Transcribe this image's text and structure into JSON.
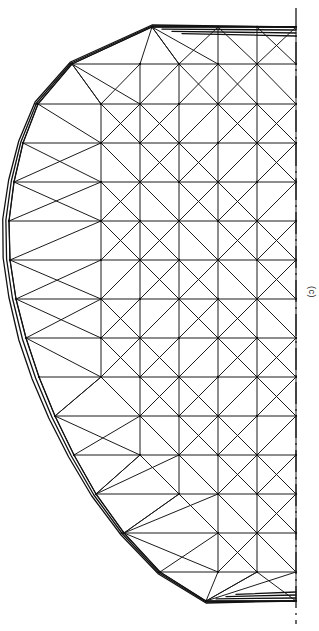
{
  "figure": {
    "panel_label": "(c)",
    "type": "finite-element-mesh",
    "colors": {
      "background": "#ffffff",
      "edge": "#1a1a1a",
      "boundary": "#111111",
      "axis": "#1a1a1a",
      "label": "#222222"
    },
    "axis": {
      "name": "axis-of-symmetry",
      "style": "dash-dot",
      "orientation": "vertical",
      "x": 296,
      "y_start": 8,
      "y_end": 624
    },
    "geometry": {
      "canvas_width": 319,
      "canvas_height": 631,
      "axis_x": 296,
      "profile_top_y": 27,
      "profile_bottom_y": 601,
      "profile_leftmost_x": 9,
      "profile_leftmost_y": 243,
      "row_y": [
        27,
        64,
        104,
        143,
        182,
        221,
        260,
        299,
        338,
        377,
        416,
        455,
        494,
        533,
        572,
        601
      ],
      "row_left_x": [
        152,
        72,
        38,
        23,
        14,
        9,
        10,
        16,
        26,
        39,
        55,
        74,
        96,
        124,
        160,
        206
      ],
      "interior_col_step": 39,
      "boundary_layer_offsets": [
        0,
        4,
        8
      ]
    }
  }
}
